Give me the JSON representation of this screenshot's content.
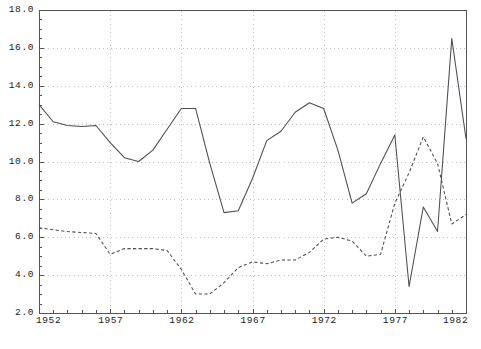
{
  "chart_data": {
    "type": "line",
    "title": "",
    "subtitle": "",
    "xlabel": "",
    "ylabel": "",
    "xlim": [
      1952,
      1982
    ],
    "ylim": [
      2.0,
      18.0
    ],
    "grid": true,
    "legend": "none",
    "x_ticks": [
      "1952",
      "1957",
      "1962",
      "1967",
      "1972",
      "1977",
      "1982"
    ],
    "x_tick_values": [
      1952,
      1957,
      1962,
      1967,
      1972,
      1977,
      1982
    ],
    "y_ticks": [
      "18.0",
      "16.0",
      "14.0",
      "12.0",
      "10.0",
      "8.0",
      "6.0",
      "4.0",
      "2.0"
    ],
    "y_tick_values": [
      18.0,
      16.0,
      14.0,
      12.0,
      10.0,
      8.0,
      6.0,
      4.0,
      2.0
    ],
    "x": [
      1952,
      1953,
      1954,
      1955,
      1956,
      1957,
      1958,
      1959,
      1960,
      1961,
      1962,
      1963,
      1964,
      1965,
      1966,
      1967,
      1968,
      1969,
      1970,
      1971,
      1972,
      1973,
      1974,
      1975,
      1976,
      1977,
      1978,
      1979,
      1980,
      1981,
      1982
    ],
    "series": [
      {
        "name": "solid-series",
        "style": "solid",
        "color": "#4c4c52",
        "values": [
          13.0,
          12.1,
          11.9,
          11.85,
          11.9,
          11.0,
          10.2,
          10.0,
          10.6,
          11.7,
          12.8,
          12.8,
          9.9,
          7.3,
          7.4,
          9.1,
          11.1,
          11.6,
          12.6,
          13.1,
          12.8,
          10.6,
          7.8,
          8.3,
          9.9,
          11.4,
          3.4,
          7.6,
          6.3,
          16.5,
          11.2
        ]
      },
      {
        "name": "dashed-series",
        "style": "dashed",
        "color": "#4c4c52",
        "values": [
          6.5,
          6.4,
          6.3,
          6.25,
          6.2,
          5.1,
          5.4,
          5.4,
          5.4,
          5.3,
          4.3,
          3.0,
          3.0,
          3.6,
          4.4,
          4.7,
          4.6,
          4.8,
          4.8,
          5.2,
          5.9,
          6.0,
          5.8,
          5.0,
          5.1,
          7.8,
          9.4,
          11.3,
          9.9,
          6.7,
          7.2
        ]
      }
    ]
  },
  "axes": {
    "y_labels": [
      "18.0",
      "16.0",
      "14.0",
      "12.0",
      "10.0",
      "8.0",
      "6.0",
      "4.0",
      "2.0"
    ],
    "x_labels": [
      "1952",
      "1957",
      "1962",
      "1967",
      "1972",
      "1977",
      "1982"
    ]
  },
  "colors": {
    "line": "#4c4c52",
    "grid": "#b9b9c4",
    "frame": "#555555",
    "text": "#1a1a1a",
    "background": "#ffffff"
  }
}
